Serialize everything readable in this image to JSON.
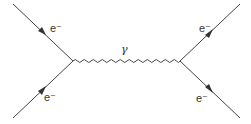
{
  "diagram": {
    "type": "feynman",
    "labels": {
      "top_left": "e⁻",
      "bottom_left": "e⁻",
      "top_right": "e⁻",
      "bottom_right": "e⁻",
      "photon": "γ"
    },
    "line_color": "#444444"
  }
}
